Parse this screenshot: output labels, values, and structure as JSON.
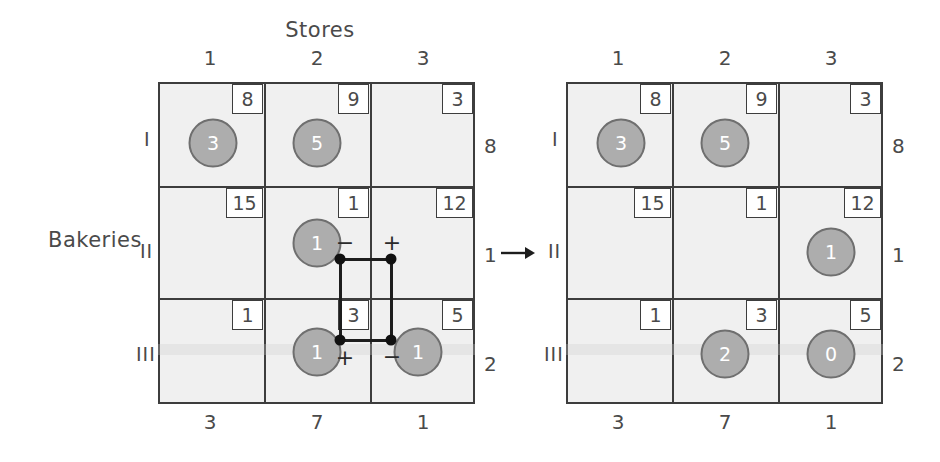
{
  "figure": {
    "columns_title": "Stores",
    "rows_title": "Bakeries",
    "transition_arrow": "→"
  },
  "column_headers": [
    "1",
    "2",
    "3"
  ],
  "row_headers": [
    "I",
    "II",
    "III"
  ],
  "demands": [
    "3",
    "7",
    "1"
  ],
  "supplies": [
    "8",
    "1",
    "2"
  ],
  "left_table": {
    "name": "current-solution",
    "costs": [
      [
        "8",
        "9",
        "3"
      ],
      [
        "15",
        "1",
        "12"
      ],
      [
        "1",
        "3",
        "5"
      ]
    ],
    "allocations": [
      [
        {
          "value": "3"
        },
        {
          "value": "5"
        },
        null
      ],
      [
        null,
        {
          "value": "1"
        },
        null
      ],
      [
        null,
        {
          "value": "1"
        },
        {
          "value": "1"
        }
      ]
    ],
    "cycle": {
      "signs": [
        {
          "label": "−",
          "cell": "II-2"
        },
        {
          "label": "+",
          "cell": "II-3"
        },
        {
          "label": "+",
          "cell": "III-2"
        },
        {
          "label": "−",
          "cell": "III-3"
        }
      ]
    }
  },
  "right_table": {
    "name": "improved-solution",
    "costs": [
      [
        "8",
        "9",
        "3"
      ],
      [
        "15",
        "1",
        "12"
      ],
      [
        "1",
        "3",
        "5"
      ]
    ],
    "allocations": [
      [
        {
          "value": "3"
        },
        {
          "value": "5"
        },
        null
      ],
      [
        null,
        null,
        {
          "value": "1"
        }
      ],
      [
        null,
        {
          "value": "2"
        },
        {
          "value": "0"
        }
      ]
    ]
  },
  "colors": {
    "grid": "#3d3d3d",
    "cell_fill": "#f0f0f0",
    "circle_fill": "#adadad",
    "circle_stroke": "#6f6f6f",
    "cycle": "#111111",
    "text": "#4a4a4a"
  }
}
